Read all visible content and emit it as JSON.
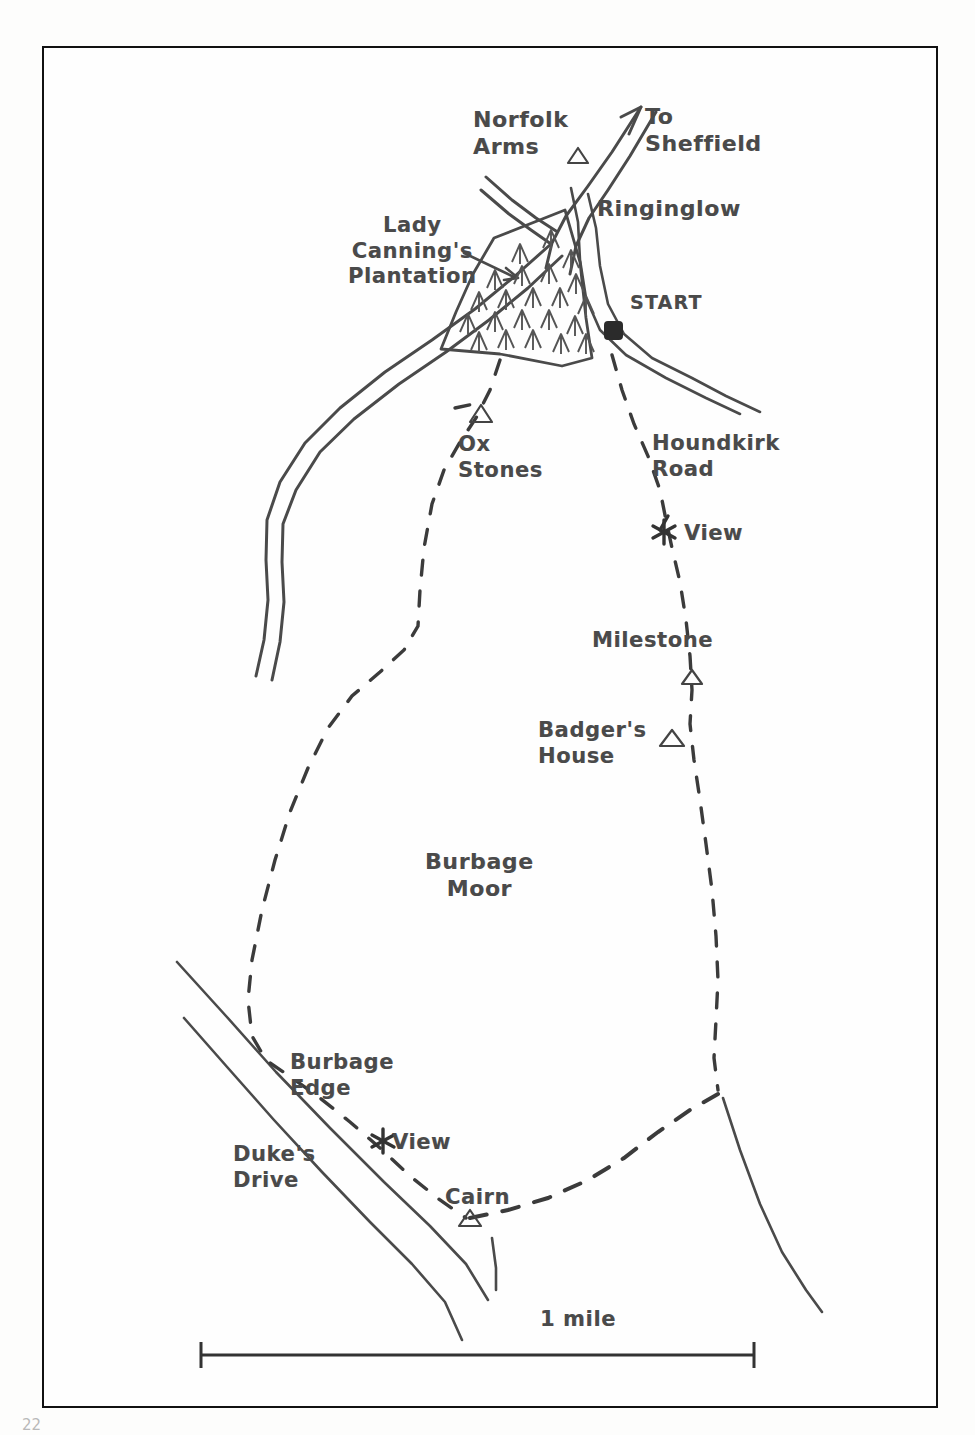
{
  "document": {
    "type": "hand-drawn-walking-route-map",
    "page_number": "22"
  },
  "map": {
    "title_area_labels": {
      "norfolk_arms": "Norfolk\nArms",
      "to_sheffield": "To\nSheffield",
      "ringinglow": "Ringinglow",
      "lady_cannings_plantation": "Lady\nCanning's\nPlantation",
      "start": "START",
      "ox_stones": "Ox\nStones",
      "houndkirk_road": "Houndkirk\nRoad",
      "view_north": "View",
      "milestone": "Milestone",
      "badgers_house": "Badger's\nHouse",
      "burbage_moor": "Burbage\nMoor",
      "burbage_edge": "Burbage\nEdge",
      "view_south": "View",
      "dukes_drive": "Duke's\nDrive",
      "cairn": "Cairn"
    },
    "scale": {
      "label": "1 mile",
      "bar_start_x": 200,
      "bar_end_x": 755,
      "bar_y": 1355
    },
    "markers": [
      {
        "name": "norfolk-arms-marker",
        "symbol": "triangle",
        "x": 578,
        "y": 157
      },
      {
        "name": "start-marker",
        "symbol": "filled-square",
        "x": 613,
        "y": 330
      },
      {
        "name": "ox-stones-marker",
        "symbol": "triangle",
        "x": 481,
        "y": 414
      },
      {
        "name": "view-north-marker",
        "symbol": "star",
        "x": 664,
        "y": 532
      },
      {
        "name": "milestone-marker",
        "symbol": "triangle",
        "x": 692,
        "y": 677
      },
      {
        "name": "badgers-house-marker",
        "symbol": "triangle",
        "x": 672,
        "y": 739
      },
      {
        "name": "view-south-marker",
        "symbol": "star",
        "x": 383,
        "y": 1140
      },
      {
        "name": "cairn-marker",
        "symbol": "triangle",
        "x": 470,
        "y": 1218
      }
    ],
    "colors": {
      "ink": "#3f3f3f",
      "frame": "#111111",
      "paper": "#fefefe",
      "label_text": "#4a4a4a"
    },
    "features": {
      "roads": [
        "A625 Ringinglow road to Sheffield (north-east)",
        "Road south-west past Lady Canning's Plantation",
        "Road east from Ringinglow past START",
        "Duke's Drive (south-west)"
      ],
      "trails": [
        "Dashed path west from plantation past Ox Stones south to Burbage Edge",
        "Dashed path south from START along Houndkirk Road past View, Milestone, Badger's House",
        "Dashed path joining at Cairn"
      ]
    }
  }
}
